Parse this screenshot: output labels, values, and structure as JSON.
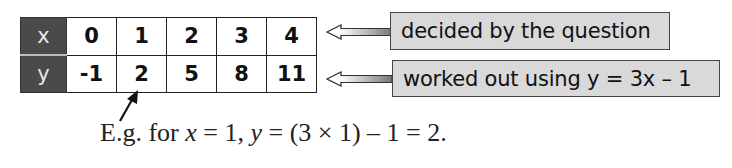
{
  "table": {
    "rows": [
      {
        "label": "x",
        "values": [
          "0",
          "1",
          "2",
          "3",
          "4"
        ]
      },
      {
        "label": "y",
        "values": [
          "-1",
          "2",
          "5",
          "8",
          "11"
        ]
      }
    ],
    "header_bg": "#4a4a4a"
  },
  "annotations": {
    "x_row_note": "decided by the question",
    "y_row_note": "worked out using y = 3x – 1",
    "box_color": "#d9d9d9"
  },
  "example": {
    "prefix": "E.g. for ",
    "var_x": "x",
    "part1": " = 1, ",
    "var_y": "y",
    "part2": " = (3 × 1) – 1 = 2."
  }
}
